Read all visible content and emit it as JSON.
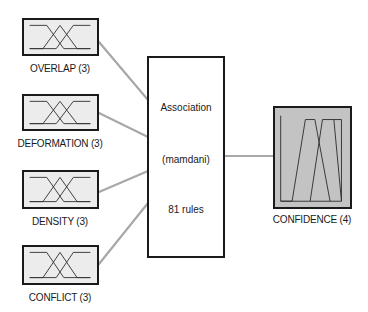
{
  "diagram": {
    "type": "fuzzy-inference-system",
    "colors": {
      "input_fill": "#ececec",
      "output_fill": "#c3c3c3",
      "border": "#1a1a1a",
      "connector": "#a8a8a8",
      "background": "#ffffff"
    },
    "inputs": [
      {
        "name": "OVERLAP",
        "mf_count": 3,
        "label": "OVERLAP (3)"
      },
      {
        "name": "DEFORMATION",
        "mf_count": 3,
        "label": "DEFORMATION (3)"
      },
      {
        "name": "DENSITY",
        "mf_count": 3,
        "label": "DENSITY (3)"
      },
      {
        "name": "CONFLICT",
        "mf_count": 3,
        "label": "CONFLICT (3)"
      }
    ],
    "rule_block": {
      "title": "Association",
      "method": "(mamdani)",
      "rules": "81 rules"
    },
    "output": {
      "name": "CONFIDENCE",
      "mf_count": 4,
      "label": "CONFIDENCE (4)"
    }
  }
}
